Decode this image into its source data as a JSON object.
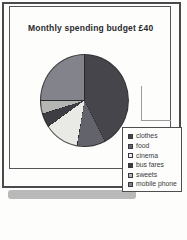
{
  "chart_data": {
    "type": "pie",
    "title": "Monthly spending budget £40",
    "budget_total": 40,
    "currency": "£",
    "categories": [
      "clothes",
      "food",
      "cinema",
      "bus fares",
      "sweets",
      "mobile phone"
    ],
    "values": [
      17,
      4,
      5,
      2,
      2,
      10
    ],
    "percentages": [
      42.5,
      10,
      12.5,
      5,
      5,
      25
    ],
    "colors": [
      "#45454b",
      "#63636b",
      "#e9e9e5",
      "#3d3d43",
      "#b5b5b3",
      "#83838b"
    ],
    "start_angle_deg": 0,
    "direction": "clockwise",
    "separator_color": "#2a2a2e",
    "legend_position": "bottom-right",
    "grid": false
  }
}
